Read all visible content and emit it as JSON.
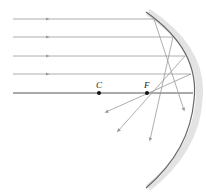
{
  "diagram": {
    "type": "concave-mirror-ray-diagram",
    "points": [
      {
        "label": "C",
        "x": 99,
        "y": 93
      },
      {
        "label": "F",
        "x": 147,
        "y": 93
      }
    ],
    "incident_rays_y": [
      19,
      37,
      56,
      74
    ],
    "principal_axis_y": 93,
    "colors": {
      "ray": "#9a9a9a",
      "axis": "#555555",
      "mirror": "#666666",
      "mirror_shadow": "#d8d8d8",
      "point": "#111111"
    }
  }
}
